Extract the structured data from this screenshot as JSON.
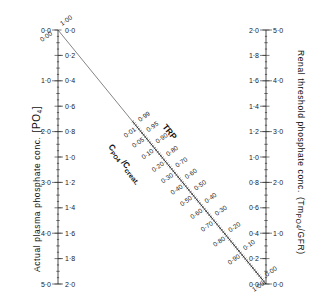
{
  "diagram": {
    "type": "nomogram",
    "left_axis": {
      "title": "Actual plasma phosphate conc.",
      "title_unit": "[PO",
      "title_unit_sub": "4",
      "title_unit_close": "]",
      "outer_ticks": [
        "0·0",
        "1·0",
        "2·0",
        "3·0",
        "4·0",
        "5·0"
      ],
      "outer_values": [
        0,
        1,
        2,
        3,
        4,
        5
      ],
      "inner_ticks": [
        "0·0",
        "0·2",
        "0·4",
        "0·6",
        "0·8",
        "1·0",
        "1·2",
        "1·4",
        "1·6",
        "1·8",
        "2·0"
      ],
      "inner_values": [
        0,
        0.2,
        0.4,
        0.6,
        0.8,
        1.0,
        1.2,
        1.4,
        1.6,
        1.8,
        2.0
      ],
      "range_outer": [
        0,
        5
      ],
      "range_inner": [
        0,
        2
      ]
    },
    "right_axis": {
      "title": "Renal threshold phosphate conc.",
      "title_unit": "(Tm",
      "title_unit_sub": "PO4",
      "title_unit_close": "/GFR)",
      "outer_ticks": [
        "2·0",
        "1·8",
        "1·6",
        "1·4",
        "1·2",
        "1·0",
        "0·8",
        "0·6",
        "0·4",
        "0·2",
        "0·0"
      ],
      "outer_values": [
        2.0,
        1.8,
        1.6,
        1.4,
        1.2,
        1.0,
        0.8,
        0.6,
        0.4,
        0.2,
        0.0
      ],
      "inner_ticks": [
        "5·0",
        "4·0",
        "3·0",
        "2·0",
        "1·0",
        "0·0"
      ],
      "inner_values": [
        5,
        4,
        3,
        2,
        1,
        0
      ],
      "range_outer": [
        2,
        0
      ],
      "range_inner": [
        5,
        0
      ]
    },
    "diagonal_scale": {
      "trp_title": "TRP",
      "trp_labels": [
        "1·00",
        "0·99",
        "0·95",
        "0·90",
        "0·80",
        "0·70",
        "0·60",
        "0·50",
        "0·40",
        "0·30",
        "0·20",
        "0·10",
        "0·00"
      ],
      "trp_values": [
        1.0,
        0.99,
        0.95,
        0.9,
        0.8,
        0.7,
        0.6,
        0.5,
        0.4,
        0.3,
        0.2,
        0.1,
        0.0
      ],
      "ratio_title": "C",
      "ratio_title_sub": "PO4",
      "ratio_title_tail": "/C",
      "ratio_title_sub2": "creat.",
      "ratio_labels": [
        "0·00",
        "0·01",
        "0·05",
        "0·10",
        "0·20",
        "0·30",
        "0·40",
        "0·50",
        "0·60",
        "0·70",
        "0·80",
        "0·90",
        "1·00"
      ],
      "ratio_values": [
        0.0,
        0.01,
        0.05,
        0.1,
        0.2,
        0.3,
        0.4,
        0.5,
        0.6,
        0.7,
        0.8,
        0.9,
        1.0
      ]
    },
    "colors": {
      "ink": "#222222",
      "background": "#ffffff"
    }
  }
}
